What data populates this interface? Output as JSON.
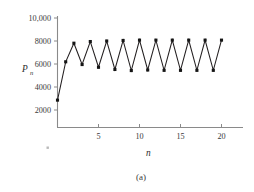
{
  "figure": {
    "caption": "(a)",
    "smudge_mark": "·"
  },
  "chart_data": {
    "type": "line",
    "title": "",
    "subtitle": "",
    "xlabel": "n",
    "ylabel": "P",
    "ylabel_subscript": "n",
    "grid": false,
    "legend": "none",
    "markers": "filled-square",
    "xlim": [
      0,
      20.6
    ],
    "ylim": [
      0,
      10000
    ],
    "xticks": [
      5,
      10,
      15,
      20
    ],
    "xtick_labels": [
      "5",
      "10",
      "15",
      "20"
    ],
    "yticks": [
      2000,
      4000,
      6000,
      8000,
      10000
    ],
    "ytick_labels": [
      "2000",
      "4000",
      "6000",
      "8000",
      "10,000"
    ],
    "x": [
      0,
      1,
      2,
      3,
      4,
      5,
      6,
      7,
      8,
      9,
      10,
      11,
      12,
      13,
      14,
      15,
      16,
      17,
      18,
      19,
      20
    ],
    "values": [
      2500,
      6000,
      7700,
      5750,
      7850,
      5500,
      7900,
      5300,
      7950,
      5200,
      7980,
      5250,
      7980,
      5220,
      7980,
      5220,
      7980,
      5220,
      7980,
      5220,
      7980
    ],
    "series": [
      {
        "name": "P_n",
        "values": [
          2500,
          6000,
          7700,
          5750,
          7850,
          5500,
          7900,
          5300,
          7950,
          5200,
          7980,
          5250,
          7980,
          5220,
          7980,
          5220,
          7980,
          5220,
          7980,
          5220,
          7980
        ]
      }
    ],
    "annotations": []
  }
}
